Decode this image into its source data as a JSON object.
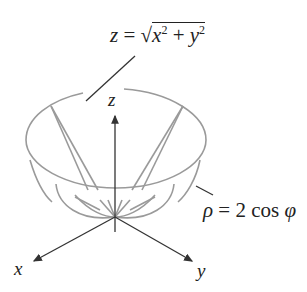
{
  "figure": {
    "surface_labels": {
      "cone": {
        "lhs": "z",
        "eq": " = ",
        "radical": "√",
        "x": "x",
        "plus": " + ",
        "y": "y",
        "exp": "2"
      },
      "sphere": {
        "rho": "ρ",
        "rest": " = 2 cos ",
        "phi": "φ"
      }
    },
    "axes": {
      "x": "x",
      "y": "y",
      "z": "z"
    },
    "colors": {
      "surface": "#9a9a9a",
      "axis": "#333333",
      "text": "#222222"
    }
  }
}
